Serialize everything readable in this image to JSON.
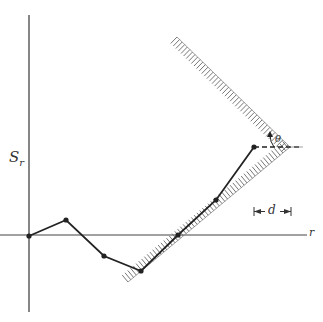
{
  "diagram": {
    "axes": {
      "vertical_label": "S",
      "vertical_label_subscript": "r",
      "horizontal_label": "r"
    },
    "annotations": {
      "angle_label": "θ",
      "distance_label": "d"
    },
    "path_points": [
      {
        "x": 29,
        "y": 236
      },
      {
        "x": 66,
        "y": 220
      },
      {
        "x": 104,
        "y": 256
      },
      {
        "x": 141,
        "y": 271
      },
      {
        "x": 178,
        "y": 235
      },
      {
        "x": 216,
        "y": 200
      },
      {
        "x": 254,
        "y": 147
      }
    ],
    "walls": {
      "vertex": {
        "x": 290,
        "y": 147
      },
      "upper_end": {
        "x": 177,
        "y": 37
      },
      "lower_end": {
        "x": 128,
        "y": 282
      }
    },
    "colors": {
      "line": "#222222",
      "hatch": "#666666"
    }
  }
}
